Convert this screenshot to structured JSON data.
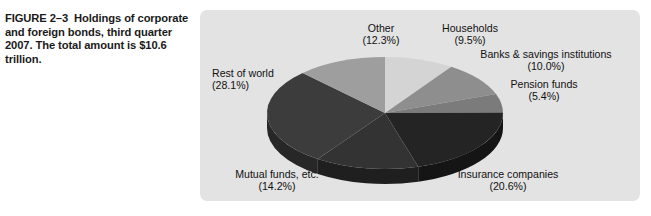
{
  "caption": {
    "figure_label": "FIGURE 2–3",
    "text": "Holdings of corporate and foreign bonds, third quarter 2007. The total amount is $10.6 trillion."
  },
  "panel": {
    "background_color": "#e3e3e3"
  },
  "chart_data": {
    "type": "pie",
    "title": "Holdings of corporate and foreign bonds, third quarter 2007",
    "subtitle": "The total amount is $10.6 trillion",
    "total_label": "$10.6 trillion",
    "legend_position": "callout-labels",
    "three_d": true,
    "start_angle_deg": 0,
    "direction": "clockwise",
    "categories": [
      "Households",
      "Banks & savings institutions",
      "Pension funds",
      "Insurance companies",
      "Mutual funds, etc.",
      "Rest of world",
      "Other"
    ],
    "values": [
      9.5,
      10.0,
      5.4,
      20.6,
      14.2,
      28.1,
      12.3
    ],
    "value_labels": [
      "(9.5%)",
      "(10.0%)",
      "(5.4%)",
      "(20.6%)",
      "(14.2%)",
      "(28.1%)",
      "(12.3%)"
    ],
    "unit": "percent",
    "colors": [
      "#d4d4d4",
      "#8e8e8e",
      "#7b7b7b",
      "#242424",
      "#333333",
      "#3c3c3c",
      "#9e9e9e"
    ],
    "side_colors": [
      "#9b9b9b",
      "#6a6a6a",
      "#5a5a5a",
      "#151515",
      "#1f1f1f",
      "#272727",
      "#757575"
    ],
    "slices": [
      {
        "label": "Households",
        "value": 9.5,
        "label_text": "Households",
        "pct_text": "(9.5%)",
        "color": "#d4d4d4"
      },
      {
        "label": "Banks & savings institutions",
        "value": 10.0,
        "label_text": "Banks & savings institutions",
        "pct_text": "(10.0%)",
        "color": "#8e8e8e"
      },
      {
        "label": "Pension funds",
        "value": 5.4,
        "label_text": "Pension funds",
        "pct_text": "(5.4%)",
        "color": "#7b7b7b"
      },
      {
        "label": "Insurance companies",
        "value": 20.6,
        "label_text": "Insurance companies",
        "pct_text": "(20.6%)",
        "color": "#242424"
      },
      {
        "label": "Mutual funds, etc.",
        "value": 14.2,
        "label_text": "Mutual funds, etc.",
        "pct_text": "(14.2%)",
        "color": "#333333"
      },
      {
        "label": "Rest of world",
        "value": 28.1,
        "label_text": "Rest of world",
        "pct_text": "(28.1%)",
        "color": "#3c3c3c"
      },
      {
        "label": "Other",
        "value": 12.3,
        "label_text": "Other",
        "pct_text": "(12.3%)",
        "color": "#9e9e9e"
      }
    ]
  }
}
